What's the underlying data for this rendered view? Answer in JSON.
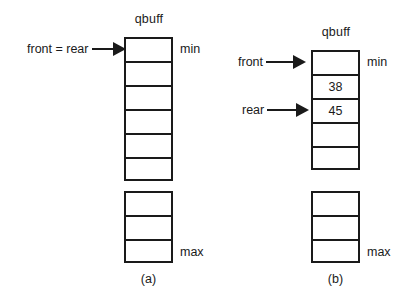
{
  "figure": {
    "background": "#ffffff",
    "ink": "#1a1a1a"
  },
  "panels": [
    {
      "id": "a",
      "caption": "(a)",
      "array_title": "qbuff",
      "min_label": "min",
      "max_label": "max",
      "upper_cells": [
        {
          "value": ""
        },
        {
          "value": ""
        },
        {
          "value": ""
        },
        {
          "value": ""
        },
        {
          "value": ""
        },
        {
          "value": ""
        }
      ],
      "lower_cells": [
        {
          "value": ""
        },
        {
          "value": ""
        },
        {
          "value": ""
        }
      ],
      "pointers": [
        {
          "label": "front = rear",
          "target_cell": 0
        }
      ]
    },
    {
      "id": "b",
      "caption": "(b)",
      "array_title": "qbuff",
      "min_label": "min",
      "max_label": "max",
      "upper_cells": [
        {
          "value": ""
        },
        {
          "value": "38"
        },
        {
          "value": "45"
        },
        {
          "value": ""
        },
        {
          "value": ""
        }
      ],
      "lower_cells": [
        {
          "value": ""
        },
        {
          "value": ""
        },
        {
          "value": ""
        }
      ],
      "pointers": [
        {
          "label": "front",
          "target_cell": 0
        },
        {
          "label": "rear",
          "target_cell": 2
        }
      ]
    }
  ]
}
